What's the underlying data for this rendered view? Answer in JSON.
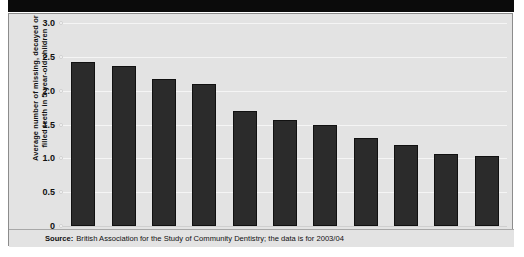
{
  "chart_data": {
    "type": "bar",
    "title": "",
    "subtitle": "",
    "xlabel": "",
    "ylabel": "Average number of missing, decayed or filled teeth in 5-year-old children",
    "ylabel_line1": "Average number of missing, decayed or",
    "ylabel_line2": "filled teeth in 5-year-old children",
    "categories": [
      "Wales",
      "Scotland",
      "NW",
      "Y&H",
      "NE",
      "London",
      "SW",
      "EM",
      "East",
      "SE",
      "WM"
    ],
    "values": [
      2.42,
      2.36,
      2.17,
      2.1,
      1.7,
      1.57,
      1.49,
      1.3,
      1.2,
      1.06,
      1.04
    ],
    "ylim": [
      0,
      3.0
    ],
    "yticks": [
      3.0,
      2.5,
      2.0,
      1.5,
      1.0,
      0.5,
      0
    ],
    "ytick_labels": [
      "3.0",
      "2.5",
      "2.0",
      "1.5",
      "1.0",
      "0.5",
      "0"
    ],
    "grid": true,
    "legend": false,
    "legend_position": "none",
    "bar_color": "#2b2b2b",
    "plot_background": "#e3e3e3",
    "gridline_color": "#f5f5f5"
  },
  "source": {
    "label": "Source:",
    "text": "British Association for the Study of Community Dentistry; the data is for 2003/04"
  },
  "colors": {
    "top_band": "#0b0b0b",
    "panel_background": "#e3e3e3",
    "frame_border": "#8c8c8c",
    "text": "#111111"
  }
}
